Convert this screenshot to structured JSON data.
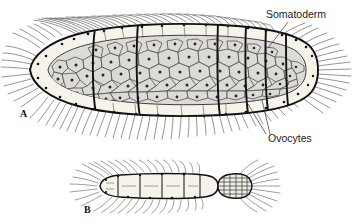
{
  "figure": {
    "background_color": "#ffffff",
    "ink_color": "#1a1a1a",
    "panels": [
      {
        "id": "A",
        "label": "A",
        "label_x": 20,
        "label_y": 117,
        "description": "Large dorsal view of gravid specimen with somatoderm wall and packed ovocytes"
      },
      {
        "id": "B",
        "label": "B",
        "label_x": 84,
        "label_y": 213,
        "description": "Smaller lateral specimen with segmented trunk and grid-patterned terminal segment"
      }
    ],
    "callouts": [
      {
        "name": "somatoderm",
        "label": "Somatoderm",
        "text_x": 266,
        "text_y": 18,
        "anchor": "start",
        "leaders": [
          {
            "x1": 288,
            "y1": 22,
            "x2": 268,
            "y2": 48
          }
        ]
      },
      {
        "name": "ovocytes",
        "label": "Ovocytes",
        "text_x": 268,
        "text_y": 142,
        "anchor": "start",
        "leaders": [
          {
            "x1": 266,
            "y1": 134,
            "x2": 248,
            "y2": 104
          },
          {
            "x1": 270,
            "y1": 134,
            "x2": 262,
            "y2": 100
          }
        ]
      }
    ],
    "colors": {
      "outline": "#111111",
      "somatoderm_band": "#f4f0e6",
      "ovocyte_fill": "#d9d9d9",
      "ovocyte_nucleus": "#2b2b2b",
      "setae": "#3a3a3a",
      "shading": "#6f6f6f"
    },
    "panel_a_geometry": {
      "left_tip_x": 30,
      "right_tip_x": 318,
      "center_y": 70,
      "max_half_height": 46,
      "segment_boundaries_x": [
        95,
        138,
        218,
        246,
        266,
        286
      ],
      "ovocyte_count_approx": 150
    },
    "panel_b_geometry": {
      "left_tip_x": 90,
      "right_tip_x": 252,
      "center_y": 186,
      "max_half_height": 11,
      "segment_boundaries_x": [
        118,
        138,
        160,
        182,
        200,
        216,
        232
      ],
      "terminal_segment_x": 200
    }
  }
}
